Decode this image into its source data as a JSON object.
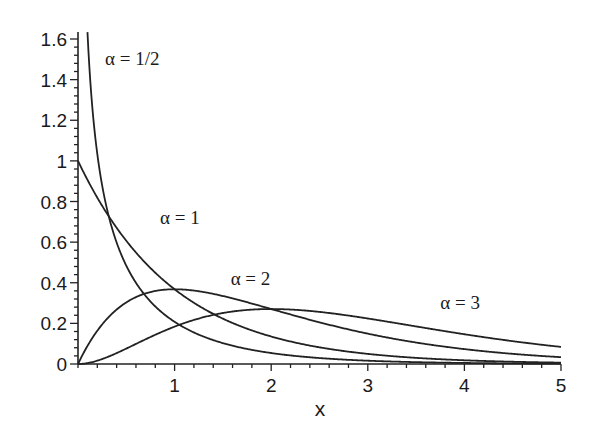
{
  "chart_data": {
    "type": "line",
    "title": "",
    "xlabel": "x",
    "ylabel": "",
    "xlim": [
      0,
      5
    ],
    "ylim": [
      0,
      1.6
    ],
    "grid": false,
    "legend": "inline curve labels",
    "x_ticks": [
      "1",
      "2",
      "3",
      "4",
      "5"
    ],
    "y_ticks": [
      "0",
      "0.2",
      "0.4",
      "0.6",
      "0.8",
      "1",
      "1.2",
      "1.4",
      "1.6"
    ],
    "x_minor_step": 0.2,
    "y_minor_step": 0.04,
    "series": [
      {
        "name": "α = 1/2",
        "alpha": 0.5,
        "x": [
          0.11,
          0.15,
          0.2,
          0.3,
          0.4,
          0.5,
          0.75,
          1,
          1.5,
          2,
          3,
          4,
          5
        ],
        "values": [
          1.52,
          1.26,
          1.03,
          0.76,
          0.6,
          0.48,
          0.31,
          0.21,
          0.1,
          0.054,
          0.016,
          0.005,
          0.002
        ]
      },
      {
        "name": "α = 1",
        "alpha": 1,
        "x": [
          0,
          0.25,
          0.5,
          0.75,
          1,
          1.5,
          2,
          2.5,
          3,
          4,
          5
        ],
        "values": [
          1.0,
          0.78,
          0.61,
          0.47,
          0.37,
          0.22,
          0.14,
          0.082,
          0.05,
          0.018,
          0.007
        ]
      },
      {
        "name": "α = 2",
        "alpha": 2,
        "x": [
          0,
          0.25,
          0.5,
          0.75,
          1,
          1.5,
          2,
          2.5,
          3,
          4,
          5
        ],
        "values": [
          0,
          0.19,
          0.3,
          0.35,
          0.37,
          0.33,
          0.27,
          0.21,
          0.15,
          0.073,
          0.034
        ]
      },
      {
        "name": "α = 3",
        "alpha": 3,
        "x": [
          0,
          0.5,
          1,
          1.5,
          2,
          2.5,
          3,
          3.5,
          4,
          4.5,
          5
        ],
        "values": [
          0,
          0.076,
          0.18,
          0.25,
          0.27,
          0.26,
          0.22,
          0.18,
          0.15,
          0.11,
          0.084
        ]
      }
    ],
    "annotations": [
      {
        "text": "α = 1/2",
        "x": 0.28,
        "y": 1.47
      },
      {
        "text": "α = 1",
        "x": 0.85,
        "y": 0.69
      },
      {
        "text": "α = 2",
        "x": 1.58,
        "y": 0.39
      },
      {
        "text": "α = 3",
        "x": 3.75,
        "y": 0.27
      }
    ]
  }
}
